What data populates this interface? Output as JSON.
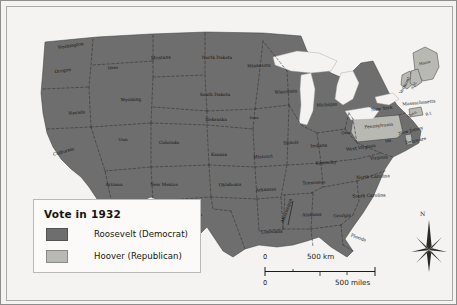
{
  "map": {
    "title": "Vote in 1932",
    "colors": {
      "roosevelt": "#6e6e6e",
      "hoover": "#b9b9b4",
      "water": "#f2f1ee",
      "background": "#f6f5f3",
      "border": "#3a3a3a"
    },
    "legend": {
      "title": "Vote in 1932",
      "entries": [
        {
          "label": "Roosevelt (Democrat)",
          "color": "#6e6e6e",
          "party": "democrat"
        },
        {
          "label": "Hoover (Republican)",
          "color": "#b9b9b4",
          "party": "republican"
        }
      ]
    },
    "scale": {
      "km": {
        "zero": "0",
        "label": "500 km"
      },
      "miles": {
        "zero": "0",
        "label": "500 miles"
      }
    },
    "compass": {
      "north_label": "N"
    },
    "states": [
      {
        "name": "Washington",
        "x": 70,
        "y": 46,
        "vote": "roosevelt",
        "rot": -9
      },
      {
        "name": "Oregon",
        "x": 62,
        "y": 71,
        "vote": "roosevelt",
        "rot": -8
      },
      {
        "name": "Idaho",
        "x": 112,
        "y": 68,
        "vote": "roosevelt",
        "rot": -4
      },
      {
        "name": "Montana",
        "x": 160,
        "y": 58,
        "vote": "roosevelt",
        "rot": -3
      },
      {
        "name": "North Dakota",
        "x": 216,
        "y": 58,
        "vote": "roosevelt",
        "rot": 0
      },
      {
        "name": "Minnesota",
        "x": 258,
        "y": 66,
        "vote": "roosevelt",
        "rot": -2
      },
      {
        "name": "Wyoming",
        "x": 130,
        "y": 100,
        "vote": "roosevelt",
        "rot": -2
      },
      {
        "name": "South Dakota",
        "x": 214,
        "y": 95,
        "vote": "roosevelt",
        "rot": 0
      },
      {
        "name": "Nevada",
        "x": 76,
        "y": 113,
        "vote": "roosevelt",
        "rot": -5
      },
      {
        "name": "Nebraska",
        "x": 215,
        "y": 120,
        "vote": "roosevelt",
        "rot": 0
      },
      {
        "name": "Iowa",
        "x": 253,
        "y": 118,
        "vote": "roosevelt",
        "rot": 0
      },
      {
        "name": "Wisconsin",
        "x": 285,
        "y": 92,
        "vote": "roosevelt",
        "rot": -4
      },
      {
        "name": "Michigan",
        "x": 326,
        "y": 105,
        "vote": "roosevelt",
        "rot": -4
      },
      {
        "name": "Utah",
        "x": 122,
        "y": 140,
        "vote": "roosevelt",
        "rot": 0
      },
      {
        "name": "California",
        "x": 63,
        "y": 152,
        "vote": "roosevelt",
        "rot": -16
      },
      {
        "name": "Colorado",
        "x": 168,
        "y": 143,
        "vote": "roosevelt",
        "rot": 0
      },
      {
        "name": "Kansas",
        "x": 218,
        "y": 155,
        "vote": "roosevelt",
        "rot": 0
      },
      {
        "name": "Missouri",
        "x": 262,
        "y": 157,
        "vote": "roosevelt",
        "rot": -3
      },
      {
        "name": "Illinois",
        "x": 290,
        "y": 143,
        "vote": "roosevelt",
        "rot": -3
      },
      {
        "name": "Indiana",
        "x": 318,
        "y": 146,
        "vote": "roosevelt",
        "rot": -3
      },
      {
        "name": "Ohio",
        "x": 345,
        "y": 133,
        "vote": "roosevelt",
        "rot": -2
      },
      {
        "name": "Kentucky",
        "x": 325,
        "y": 163,
        "vote": "roosevelt",
        "rot": -4
      },
      {
        "name": "West Virginia",
        "x": 360,
        "y": 148,
        "vote": "roosevelt",
        "rot": -8
      },
      {
        "name": "Virginia",
        "x": 378,
        "y": 158,
        "vote": "roosevelt",
        "rot": -5
      },
      {
        "name": "Tennessee",
        "x": 313,
        "y": 183,
        "vote": "roosevelt",
        "rot": -3
      },
      {
        "name": "North Carolina",
        "x": 372,
        "y": 177,
        "vote": "roosevelt",
        "rot": -3
      },
      {
        "name": "South Carolina",
        "x": 368,
        "y": 196,
        "vote": "roosevelt",
        "rot": -2
      },
      {
        "name": "Arizona",
        "x": 113,
        "y": 185,
        "vote": "roosevelt",
        "rot": 0
      },
      {
        "name": "New Mexico",
        "x": 163,
        "y": 185,
        "vote": "roosevelt",
        "rot": 0
      },
      {
        "name": "Oklahoma",
        "x": 229,
        "y": 185,
        "vote": "roosevelt",
        "rot": -1
      },
      {
        "name": "Arkansas",
        "x": 265,
        "y": 190,
        "vote": "roosevelt",
        "rot": -3
      },
      {
        "name": "Texas",
        "x": 196,
        "y": 215,
        "vote": "roosevelt",
        "rot": -2
      },
      {
        "name": "Louisiana",
        "x": 271,
        "y": 232,
        "vote": "roosevelt",
        "rot": -2
      },
      {
        "name": "Mississippi",
        "x": 287,
        "y": 210,
        "vote": "roosevelt",
        "rot": -70
      },
      {
        "name": "Alabama",
        "x": 311,
        "y": 215,
        "vote": "roosevelt",
        "rot": -2
      },
      {
        "name": "Georgia",
        "x": 341,
        "y": 216,
        "vote": "roosevelt",
        "rot": -2
      },
      {
        "name": "Florida",
        "x": 357,
        "y": 238,
        "vote": "roosevelt",
        "rot": 20
      },
      {
        "name": "New York",
        "x": 381,
        "y": 109,
        "vote": "roosevelt",
        "rot": -7
      },
      {
        "name": "Maine",
        "x": 424,
        "y": 63,
        "vote": "hoover",
        "rot": -12
      },
      {
        "name": "Vermont",
        "x": 405,
        "y": 85,
        "vote": "hoover",
        "rot": -62
      },
      {
        "name": "N.H.",
        "x": 414,
        "y": 85,
        "vote": "hoover",
        "rot": -62
      },
      {
        "name": "Massachusetts",
        "x": 418,
        "y": 103,
        "vote": "roosevelt",
        "rot": -6
      },
      {
        "name": "Conn.",
        "x": 412,
        "y": 114,
        "vote": "hoover",
        "rot": -30
      },
      {
        "name": "R.I.",
        "x": 428,
        "y": 114,
        "vote": "roosevelt",
        "rot": -12
      },
      {
        "name": "Pennsylvania",
        "x": 378,
        "y": 126,
        "vote": "hoover",
        "rot": -6
      },
      {
        "name": "New Jersey",
        "x": 410,
        "y": 131,
        "vote": "roosevelt",
        "rot": -14
      },
      {
        "name": "Delaware",
        "x": 415,
        "y": 141,
        "vote": "hoover",
        "rot": -12
      },
      {
        "name": "Md.",
        "x": 388,
        "y": 141,
        "vote": "roosevelt",
        "rot": -12
      }
    ]
  }
}
